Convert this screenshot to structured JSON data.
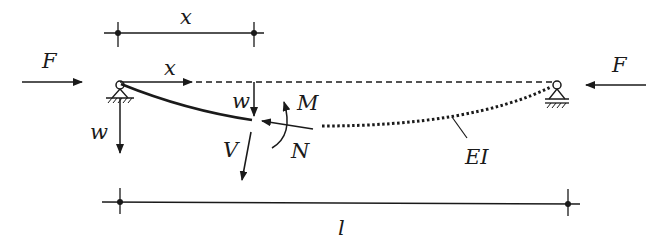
{
  "diagram": {
    "labels": {
      "dim_top": "x",
      "force_left": "F",
      "force_right": "F",
      "axis_x": "x",
      "deflection_mid": "w",
      "deflection_left": "w",
      "moment": "M",
      "normal_force": "N",
      "shear_force": "V",
      "stiffness": "EI",
      "length": "l"
    },
    "colors": {
      "ink": "#1a1a1a",
      "background": "#ffffff"
    }
  }
}
